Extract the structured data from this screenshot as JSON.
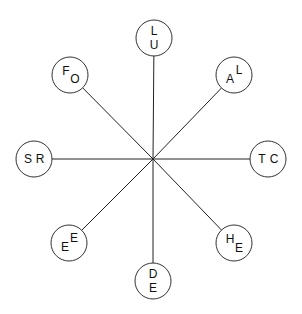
{
  "diagram": {
    "type": "radial-spoke",
    "center": {
      "x": 153,
      "y": 159
    },
    "radius": 18,
    "stroke_color": "#333333",
    "nodes": [
      {
        "position": "top",
        "cx": 154,
        "cy": 38,
        "letters": [
          {
            "t": "L",
            "dx": 0,
            "dy": -7
          },
          {
            "t": "U",
            "dx": 0,
            "dy": 7
          }
        ]
      },
      {
        "position": "top-right",
        "cx": 234,
        "cy": 75,
        "letters": [
          {
            "t": "L",
            "dx": 5,
            "dy": -5
          },
          {
            "t": "A",
            "dx": -4,
            "dy": 4
          }
        ]
      },
      {
        "position": "right",
        "cx": 268,
        "cy": 159,
        "letters": [
          {
            "t": "T",
            "dx": -6,
            "dy": 0
          },
          {
            "t": "C",
            "dx": 6,
            "dy": 0
          }
        ]
      },
      {
        "position": "bottom-right",
        "cx": 234,
        "cy": 243,
        "letters": [
          {
            "t": "H",
            "dx": -4,
            "dy": -4
          },
          {
            "t": "E",
            "dx": 5,
            "dy": 5
          }
        ]
      },
      {
        "position": "bottom",
        "cx": 153,
        "cy": 281,
        "letters": [
          {
            "t": "D",
            "dx": 0,
            "dy": -7
          },
          {
            "t": "E",
            "dx": 0,
            "dy": 7
          }
        ]
      },
      {
        "position": "bottom-left",
        "cx": 69,
        "cy": 243,
        "letters": [
          {
            "t": "E",
            "dx": 5,
            "dy": -5
          },
          {
            "t": "E",
            "dx": -4,
            "dy": 4
          }
        ]
      },
      {
        "position": "left",
        "cx": 34,
        "cy": 159,
        "letters": [
          {
            "t": "S",
            "dx": -6,
            "dy": 0
          },
          {
            "t": "R",
            "dx": 6,
            "dy": 0
          }
        ]
      },
      {
        "position": "top-left",
        "cx": 70,
        "cy": 75,
        "letters": [
          {
            "t": "F",
            "dx": -4,
            "dy": -4
          },
          {
            "t": "O",
            "dx": 5,
            "dy": 4
          }
        ]
      }
    ]
  }
}
